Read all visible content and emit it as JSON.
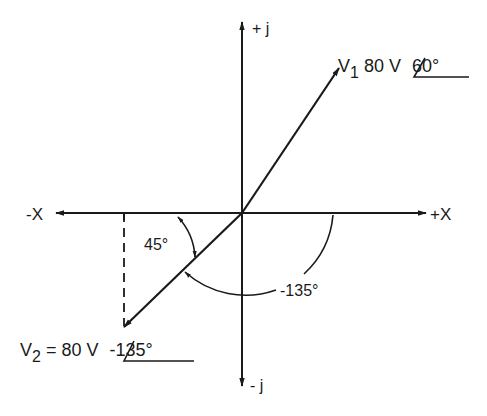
{
  "diagram": {
    "type": "phasor",
    "axes": {
      "pos_real": "+X",
      "neg_real": "-X",
      "pos_imag": "+ j",
      "neg_imag": "- j"
    },
    "phasors": [
      {
        "name": "V",
        "subscript": "1",
        "text_mid": " 80 V ",
        "angle_text": "60°",
        "magnitude": 80,
        "unit": "V",
        "angle_deg": 60
      },
      {
        "name": "V",
        "subscript": "2",
        "text_mid": " = 80 V ",
        "angle_text": "-135°",
        "magnitude": 80,
        "unit": "V",
        "angle_deg": -135
      }
    ],
    "angle_labels": {
      "reference_angle": "45°",
      "phase_angle": "-135°"
    },
    "colors": {
      "ink": "#1a1a1a",
      "background": "#ffffff"
    }
  }
}
